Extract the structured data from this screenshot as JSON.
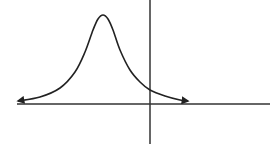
{
  "chart_data": {
    "type": "line",
    "title": "",
    "xlabel": "",
    "ylabel": "",
    "grid": false,
    "legend": null,
    "axes": {
      "x_axis": {
        "y_px": 104,
        "from_px": 17,
        "to_px": 270
      },
      "y_axis": {
        "x_px": 150,
        "from_px": 0,
        "to_px": 144
      }
    },
    "peak": {
      "x_px": 103,
      "y_px": 15
    },
    "y_intercept_px": 90,
    "curve_points_px": [
      [
        18,
        101
      ],
      [
        40,
        97
      ],
      [
        60,
        88
      ],
      [
        75,
        72
      ],
      [
        85,
        52
      ],
      [
        93,
        30
      ],
      [
        98,
        19
      ],
      [
        103,
        15
      ],
      [
        108,
        19
      ],
      [
        113,
        30
      ],
      [
        120,
        50
      ],
      [
        130,
        70
      ],
      [
        140,
        82
      ],
      [
        150,
        90
      ],
      [
        165,
        96
      ],
      [
        180,
        100
      ],
      [
        188,
        101
      ]
    ],
    "tails": {
      "left": "arrow",
      "right": "arrow"
    },
    "colors": {
      "curve": "#222222",
      "axes": "#333333",
      "background": "#ffffff"
    }
  }
}
